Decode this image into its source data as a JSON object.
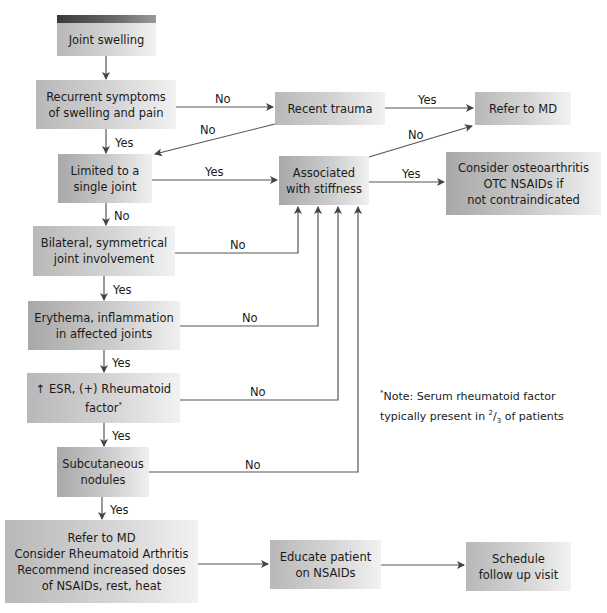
{
  "nodes": {
    "joint_swelling": {
      "line1": "Joint swelling"
    },
    "recurrent": {
      "line1": "Recurrent symptoms",
      "line2": "of swelling and pain"
    },
    "recent_trauma": {
      "line1": "Recent trauma"
    },
    "refer_md_top": {
      "line1": "Refer to MD"
    },
    "limited": {
      "line1": "Limited to a",
      "line2": "single joint"
    },
    "associated": {
      "line1": "Associated",
      "line2": "with stiffness"
    },
    "osteo": {
      "line1": "Consider osteoarthritis",
      "line2": "OTC NSAIDs if",
      "line3": "not contraindicated"
    },
    "bilateral": {
      "line1": "Bilateral, symmetrical",
      "line2": "joint involvement"
    },
    "erythema": {
      "line1": "Erythema, inflammation",
      "line2": "in affected joints"
    },
    "esr": {
      "line1": "↑ ESR, (+) Rheumatoid",
      "line2": "factor",
      "sup": "*"
    },
    "subcut": {
      "line1": "Subcutaneous",
      "line2": "nodules"
    },
    "refer_ra": {
      "line1": "Refer to MD",
      "line2": "Consider Rheumatoid Arthritis",
      "line3": "Recommend increased doses",
      "line4": "of NSAIDs, rest, heat"
    },
    "educate": {
      "line1": "Educate patient",
      "line2": "on NSAIDs"
    },
    "schedule": {
      "line1": "Schedule",
      "line2": "follow up visit"
    }
  },
  "edges": {
    "recurrent_no": "No",
    "trauma_yes": "Yes",
    "trauma_no": "No",
    "recurrent_yes": "Yes",
    "limited_yes": "Yes",
    "limited_no": "No",
    "assoc_no": "No",
    "assoc_yes": "Yes",
    "bilateral_no": "No",
    "bilateral_yes": "Yes",
    "erythema_no": "No",
    "erythema_yes": "Yes",
    "esr_no": "No",
    "esr_yes": "Yes",
    "subcut_no": "No",
    "subcut_yes": "Yes"
  },
  "note": {
    "star": "*",
    "line1": "Note: Serum rheumatoid factor",
    "line2_a": "typically present in ",
    "frac_num": "2",
    "frac_den": "3",
    "line2_b": " of patients"
  },
  "colors": {
    "line": "#444444",
    "box_light": "#f2f2f2",
    "box_dark": "#b8b8b8",
    "header_bar": "#3a3a3a"
  }
}
